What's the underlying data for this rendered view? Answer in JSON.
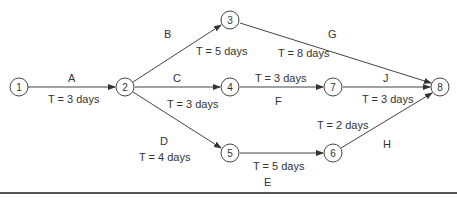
{
  "diagram": {
    "type": "activity-on-arrow network",
    "nodes": [
      {
        "id": "1",
        "label": "1"
      },
      {
        "id": "2",
        "label": "2"
      },
      {
        "id": "3",
        "label": "3"
      },
      {
        "id": "4",
        "label": "4"
      },
      {
        "id": "5",
        "label": "5"
      },
      {
        "id": "6",
        "label": "6"
      },
      {
        "id": "7",
        "label": "7"
      },
      {
        "id": "8",
        "label": "8"
      }
    ],
    "activities": [
      {
        "name": "A",
        "from": "1",
        "to": "2",
        "duration": "T = 3 days"
      },
      {
        "name": "B",
        "from": "2",
        "to": "3",
        "duration": "T = 5 days"
      },
      {
        "name": "C",
        "from": "2",
        "to": "4",
        "duration": "T = 3 days"
      },
      {
        "name": "D",
        "from": "2",
        "to": "5",
        "duration": "T = 4 days"
      },
      {
        "name": "E",
        "from": "5",
        "to": "6",
        "duration": "T = 5 days"
      },
      {
        "name": "F",
        "from": "4",
        "to": "7",
        "duration": "T = 3 days"
      },
      {
        "name": "G",
        "from": "3",
        "to": "8",
        "duration": "T = 8 days"
      },
      {
        "name": "H",
        "from": "6",
        "to": "8",
        "duration": "T = 2 days"
      },
      {
        "name": "J",
        "from": "7",
        "to": "8",
        "duration": "T = 3 days"
      }
    ]
  }
}
